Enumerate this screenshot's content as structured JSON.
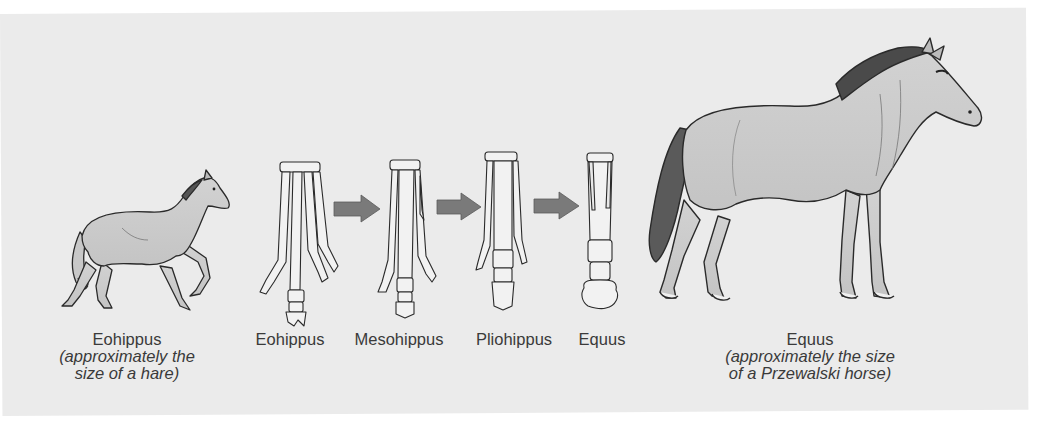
{
  "figure": {
    "background_color": "#ebebeb",
    "arrow_color": "#7a7a7a",
    "body_fill_color": "#cfcfcf",
    "bone_fill_color": "#f2f2f2",
    "stages": [
      {
        "name": "Eohippus",
        "kind": "whole-animal",
        "size_note_line1": "(approximately the",
        "size_note_line2": "size of a hare)"
      },
      {
        "name": "Eohippus",
        "kind": "foot-bones"
      },
      {
        "name": "Mesohippus",
        "kind": "foot-bones"
      },
      {
        "name": "Pliohippus",
        "kind": "foot-bones"
      },
      {
        "name": "Equus",
        "kind": "foot-bones"
      },
      {
        "name": "Equus",
        "kind": "whole-animal",
        "size_note_line1": "(approximately the size",
        "size_note_line2": "of a Przewalski horse)"
      }
    ],
    "arrows": [
      "arrow-eohippus-to-mesohippus",
      "arrow-mesohippus-to-pliohippus",
      "arrow-pliohippus-to-equus"
    ]
  }
}
